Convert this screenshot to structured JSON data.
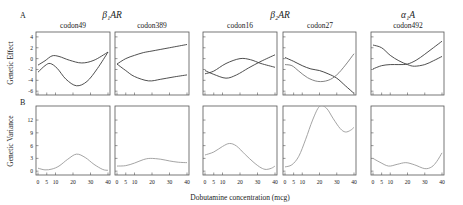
{
  "figure": {
    "panel_labels": {
      "A": "A",
      "B": "B"
    },
    "group_titles": [
      "β₁AR",
      "β₂AR",
      "α₁A"
    ],
    "codon_titles": [
      "codon49",
      "codon389",
      "codon16",
      "codon27",
      "codon492"
    ],
    "ylabel_top": "Genetic Effect",
    "ylabel_bottom": "Genetic Variance",
    "xlabel": "Dobutamine concentration (mcg)"
  },
  "chart_data": [
    {
      "type": "line",
      "row": 0,
      "col": 0,
      "title": "β₁AR codon49",
      "xlabel": "Dobutamine concentration (mcg)",
      "ylabel": "Genetic Effect",
      "xlim": [
        0,
        40
      ],
      "ylim": [
        -6.7,
        4.9
      ],
      "xticks": [
        0,
        5,
        10,
        20,
        30,
        40
      ],
      "yticks": [
        4,
        2,
        0,
        -2,
        -4,
        -6
      ],
      "series": [
        {
          "name": "effect 1",
          "color": "#3c3c3c",
          "x": [
            0,
            4,
            8,
            12,
            18,
            25,
            32,
            40
          ],
          "values": [
            -1.2,
            -0.4,
            0.5,
            0.4,
            -0.3,
            -0.8,
            -0.3,
            1.2
          ]
        },
        {
          "name": "effect 2",
          "color": "#3c3c3c",
          "x": [
            0,
            4,
            7,
            11,
            16,
            22,
            28,
            34,
            40
          ],
          "values": [
            -2.5,
            -1.3,
            -0.9,
            -1.8,
            -3.8,
            -5.0,
            -4.2,
            -1.8,
            1.2
          ]
        }
      ]
    },
    {
      "type": "line",
      "row": 0,
      "col": 1,
      "title": "β₁AR codon389",
      "xlabel": "Dobutamine concentration (mcg)",
      "ylabel": "Genetic Effect",
      "xlim": [
        0,
        40
      ],
      "ylim": [
        -6.7,
        4.9
      ],
      "xticks": [
        0,
        5,
        10,
        20,
        30,
        40
      ],
      "yticks": [
        4,
        2,
        0,
        -2,
        -4,
        -6
      ],
      "series": [
        {
          "name": "effect 1",
          "color": "#3c3c3c",
          "x": [
            0,
            5,
            10,
            15,
            20,
            30,
            40
          ],
          "values": [
            -1.0,
            0.0,
            0.6,
            1.1,
            1.4,
            2.0,
            2.6
          ]
        },
        {
          "name": "effect 2",
          "color": "#3c3c3c",
          "x": [
            0,
            5,
            10,
            18,
            25,
            32,
            40
          ],
          "values": [
            -1.0,
            -2.2,
            -3.3,
            -4.1,
            -3.8,
            -3.4,
            -3.0
          ]
        }
      ]
    },
    {
      "type": "line",
      "row": 0,
      "col": 2,
      "title": "β₂AR codon16",
      "xlabel": "Dobutamine concentration (mcg)",
      "ylabel": "Genetic Effect",
      "xlim": [
        0,
        40
      ],
      "ylim": [
        -6.7,
        4.9
      ],
      "xticks": [
        0,
        5,
        10,
        20,
        30,
        40
      ],
      "yticks": [
        4,
        2,
        0,
        -2,
        -4,
        -6
      ],
      "series": [
        {
          "name": "effect 1",
          "color": "#3c3c3c",
          "x": [
            0,
            5,
            12,
            18,
            25,
            32,
            40
          ],
          "values": [
            -2.2,
            -2.9,
            -3.6,
            -3.0,
            -1.7,
            -0.5,
            0.7
          ]
        },
        {
          "name": "effect 2",
          "color": "#3c3c3c",
          "x": [
            0,
            5,
            12,
            20,
            26,
            32,
            40
          ],
          "values": [
            -2.8,
            -2.3,
            -0.9,
            0.0,
            -0.2,
            -0.9,
            -1.6
          ]
        }
      ]
    },
    {
      "type": "line",
      "row": 0,
      "col": 3,
      "title": "β₂AR codon27",
      "xlabel": "Dobutamine concentration (mcg)",
      "ylabel": "Genetic Effect",
      "xlim": [
        0,
        40
      ],
      "ylim": [
        -6.7,
        4.9
      ],
      "xticks": [
        0,
        5,
        10,
        20,
        30,
        40
      ],
      "yticks": [
        4,
        2,
        0,
        -2,
        -4,
        -6
      ],
      "series": [
        {
          "name": "effect 1",
          "color": "#333333",
          "x": [
            0,
            5,
            10,
            15,
            20,
            25,
            30,
            35,
            40
          ],
          "values": [
            0.2,
            -0.5,
            -1.3,
            -1.9,
            -2.2,
            -2.8,
            -3.6,
            -5.0,
            -6.4
          ]
        },
        {
          "name": "effect 2",
          "color": "#777777",
          "x": [
            0,
            4,
            8,
            13,
            19,
            25,
            30,
            35,
            40
          ],
          "values": [
            -1.1,
            -1.3,
            -2.3,
            -3.5,
            -4.2,
            -4.0,
            -3.0,
            -1.2,
            0.9
          ]
        }
      ]
    },
    {
      "type": "line",
      "row": 0,
      "col": 4,
      "title": "α₁A codon492",
      "xlabel": "Dobutamine concentration (mcg)",
      "ylabel": "Genetic Effect",
      "xlim": [
        0,
        40
      ],
      "ylim": [
        -6.7,
        4.9
      ],
      "xticks": [
        0,
        5,
        10,
        20,
        30,
        40
      ],
      "yticks": [
        4,
        2,
        0,
        -2,
        -4,
        -6
      ],
      "series": [
        {
          "name": "effect 1",
          "color": "#3c3c3c",
          "x": [
            0,
            5,
            10,
            15,
            20,
            24,
            30,
            35,
            40
          ],
          "values": [
            2.5,
            2.0,
            0.6,
            -0.4,
            -1.1,
            -1.4,
            -1.1,
            -0.4,
            0.4
          ]
        },
        {
          "name": "effect 2",
          "color": "#3c3c3c",
          "x": [
            0,
            5,
            10,
            15,
            20,
            25,
            30,
            35,
            40
          ],
          "values": [
            -1.9,
            -1.3,
            -1.1,
            -1.1,
            -1.0,
            -0.3,
            0.8,
            2.0,
            3.2
          ]
        }
      ]
    },
    {
      "type": "line",
      "row": 1,
      "col": 0,
      "title": "β₁AR codon49",
      "xlabel": "Dobutamine concentration (mcg)",
      "ylabel": "Genetic Variance",
      "xlim": [
        0,
        40
      ],
      "ylim": [
        -0.9,
        15.3
      ],
      "xticks": [
        0,
        5,
        10,
        20,
        30,
        40
      ],
      "yticks": [
        0,
        3,
        6,
        9,
        12
      ],
      "series": [
        {
          "name": "variance",
          "color": "#9a9a9a",
          "x": [
            0,
            4,
            8,
            12,
            17,
            22,
            27,
            32,
            37,
            40
          ],
          "values": [
            0.7,
            0.3,
            0.5,
            1.2,
            2.8,
            4.0,
            3.2,
            1.6,
            0.4,
            0.2
          ]
        }
      ]
    },
    {
      "type": "line",
      "row": 1,
      "col": 1,
      "title": "β₁AR codon389",
      "xlabel": "Dobutamine concentration (mcg)",
      "ylabel": "Genetic Variance",
      "xlim": [
        0,
        40
      ],
      "ylim": [
        -0.9,
        15.3
      ],
      "xticks": [
        0,
        5,
        10,
        20,
        30,
        40
      ],
      "yticks": [
        0,
        3,
        6,
        9,
        12
      ],
      "series": [
        {
          "name": "variance",
          "color": "#9a9a9a",
          "x": [
            0,
            5,
            10,
            15,
            19,
            25,
            30,
            35,
            40
          ],
          "values": [
            1.2,
            1.3,
            1.9,
            2.7,
            3.0,
            2.8,
            2.4,
            2.1,
            2.0
          ]
        }
      ]
    },
    {
      "type": "line",
      "row": 1,
      "col": 2,
      "title": "β₂AR codon16",
      "xlabel": "Dobutamine concentration (mcg)",
      "ylabel": "Genetic Variance",
      "xlim": [
        0,
        40
      ],
      "ylim": [
        -0.9,
        15.3
      ],
      "xticks": [
        0,
        5,
        10,
        20,
        30,
        40
      ],
      "yticks": [
        0,
        3,
        6,
        9,
        12
      ],
      "series": [
        {
          "name": "variance",
          "color": "#9a9a9a",
          "x": [
            0,
            5,
            10,
            14,
            18,
            23,
            28,
            32,
            35,
            38,
            40
          ],
          "values": [
            3.8,
            4.5,
            5.8,
            6.5,
            5.9,
            3.9,
            2.0,
            0.8,
            0.4,
            0.7,
            1.2
          ]
        }
      ]
    },
    {
      "type": "line",
      "row": 1,
      "col": 3,
      "title": "β₂AR codon27",
      "xlabel": "Dobutamine concentration (mcg)",
      "ylabel": "Genetic Variance",
      "xlim": [
        0,
        40
      ],
      "ylim": [
        -0.9,
        15.3
      ],
      "xticks": [
        0,
        5,
        10,
        20,
        30,
        40
      ],
      "yticks": [
        0,
        3,
        6,
        9,
        12
      ],
      "series": [
        {
          "name": "variance",
          "color": "#9a9a9a",
          "x": [
            0,
            4,
            8,
            12,
            16,
            20,
            24,
            28,
            32,
            35,
            38,
            40
          ],
          "values": [
            1.0,
            1.5,
            3.5,
            7.5,
            12.0,
            15.2,
            14.8,
            12.3,
            10.0,
            9.2,
            9.6,
            10.3
          ]
        }
      ]
    },
    {
      "type": "line",
      "row": 1,
      "col": 4,
      "title": "α₁A codon492",
      "xlabel": "Dobutamine concentration (mcg)",
      "ylabel": "Genetic Variance",
      "xlim": [
        0,
        40
      ],
      "ylim": [
        -0.9,
        15.3
      ],
      "xticks": [
        0,
        5,
        10,
        20,
        30,
        40
      ],
      "yticks": [
        0,
        3,
        6,
        9,
        12
      ],
      "series": [
        {
          "name": "variance",
          "color": "#9a9a9a",
          "x": [
            0,
            4,
            9,
            14,
            19,
            24,
            30,
            34,
            37,
            40
          ],
          "values": [
            3.0,
            2.1,
            1.2,
            1.6,
            2.0,
            1.5,
            0.6,
            1.0,
            2.3,
            4.3
          ]
        }
      ]
    }
  ]
}
